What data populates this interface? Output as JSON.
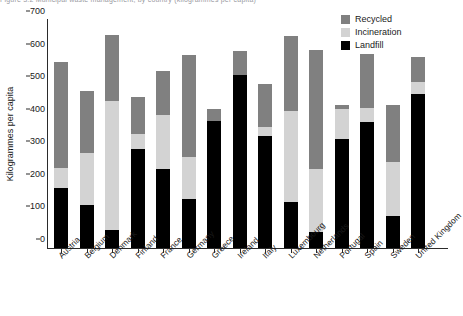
{
  "title_sliver": "Figure 3.2  Municipal waste management, by country (kilogrammes per capita)",
  "legend": {
    "position": "top-right",
    "entries": [
      {
        "label": "Recycled",
        "color": "#808080"
      },
      {
        "label": "Incineration",
        "color": "#d3d3d3"
      },
      {
        "label": "Landfill",
        "color": "#000000"
      }
    ]
  },
  "axes": {
    "ylabel": "Kilogrammes per capita",
    "yticks": [
      0,
      100,
      200,
      300,
      400,
      500,
      600,
      700
    ],
    "ylim": [
      0,
      700
    ],
    "xlabel": ""
  },
  "chart_data": {
    "type": "bar",
    "subtype": "stacked-vertical",
    "title": "Figure 3.2  Municipal waste management, by country (kilogrammes per capita)",
    "xlabel": "",
    "ylabel": "Kilogrammes per capita",
    "ylim": [
      0,
      700
    ],
    "yticks": [
      0,
      100,
      200,
      300,
      400,
      500,
      600,
      700
    ],
    "grid": false,
    "legend_position": "top-right",
    "stack_order_bottom_to_top": [
      "Landfill",
      "Incineration",
      "Recycled"
    ],
    "categories": [
      "Austria",
      "Belgium",
      "Denmark",
      "Finland",
      "France",
      "Germany",
      "Greece",
      "Ireland",
      "Italy",
      "Luxembourg",
      "Netherlands",
      "Portugal",
      "Spain",
      "Sweden",
      "United Kingdom"
    ],
    "series": [
      {
        "name": "Landfill",
        "color": "#000000",
        "values": [
          185,
          133,
          55,
          305,
          242,
          150,
          390,
          532,
          343,
          142,
          50,
          335,
          388,
          98,
          472
        ]
      },
      {
        "name": "Incineration",
        "color": "#d3d3d3",
        "values": [
          60,
          160,
          395,
          45,
          165,
          130,
          0,
          0,
          30,
          278,
          192,
          93,
          42,
          165,
          38
        ]
      },
      {
        "name": "Recycled",
        "color": "#808080",
        "values": [
          325,
          190,
          205,
          115,
          136,
          312,
          38,
          73,
          132,
          230,
          365,
          12,
          167,
          175,
          78
        ]
      }
    ],
    "totals": [
      570,
      483,
      655,
      465,
      543,
      592,
      428,
      605,
      505,
      650,
      607,
      440,
      597,
      438,
      588
    ]
  }
}
